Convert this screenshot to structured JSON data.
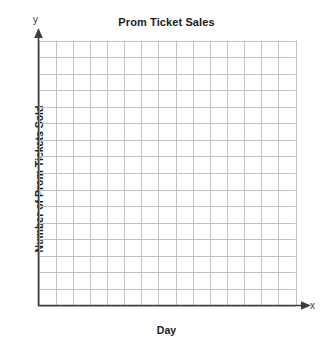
{
  "chart_data": {
    "type": "grid",
    "title": "Prom Ticket Sales",
    "xlabel": "Day",
    "ylabel": "Number of Prom Tickets Sold",
    "x_axis_marker": "x",
    "y_axis_marker": "y",
    "grid": true,
    "grid_columns": 15,
    "grid_rows": 16,
    "xlim": [
      0,
      15
    ],
    "ylim": [
      0,
      16
    ],
    "xtick_labels": [],
    "ytick_labels": [],
    "series": [],
    "values": [],
    "categories": [],
    "annotations": [],
    "legend": null,
    "note": "Empty coordinate grid worksheet with no plotted data points",
    "colors": {
      "background": "#ffffff",
      "grid_line": "#c2c2c2",
      "axis_line": "#3d3d3d",
      "text": "#1b1b1b"
    }
  }
}
